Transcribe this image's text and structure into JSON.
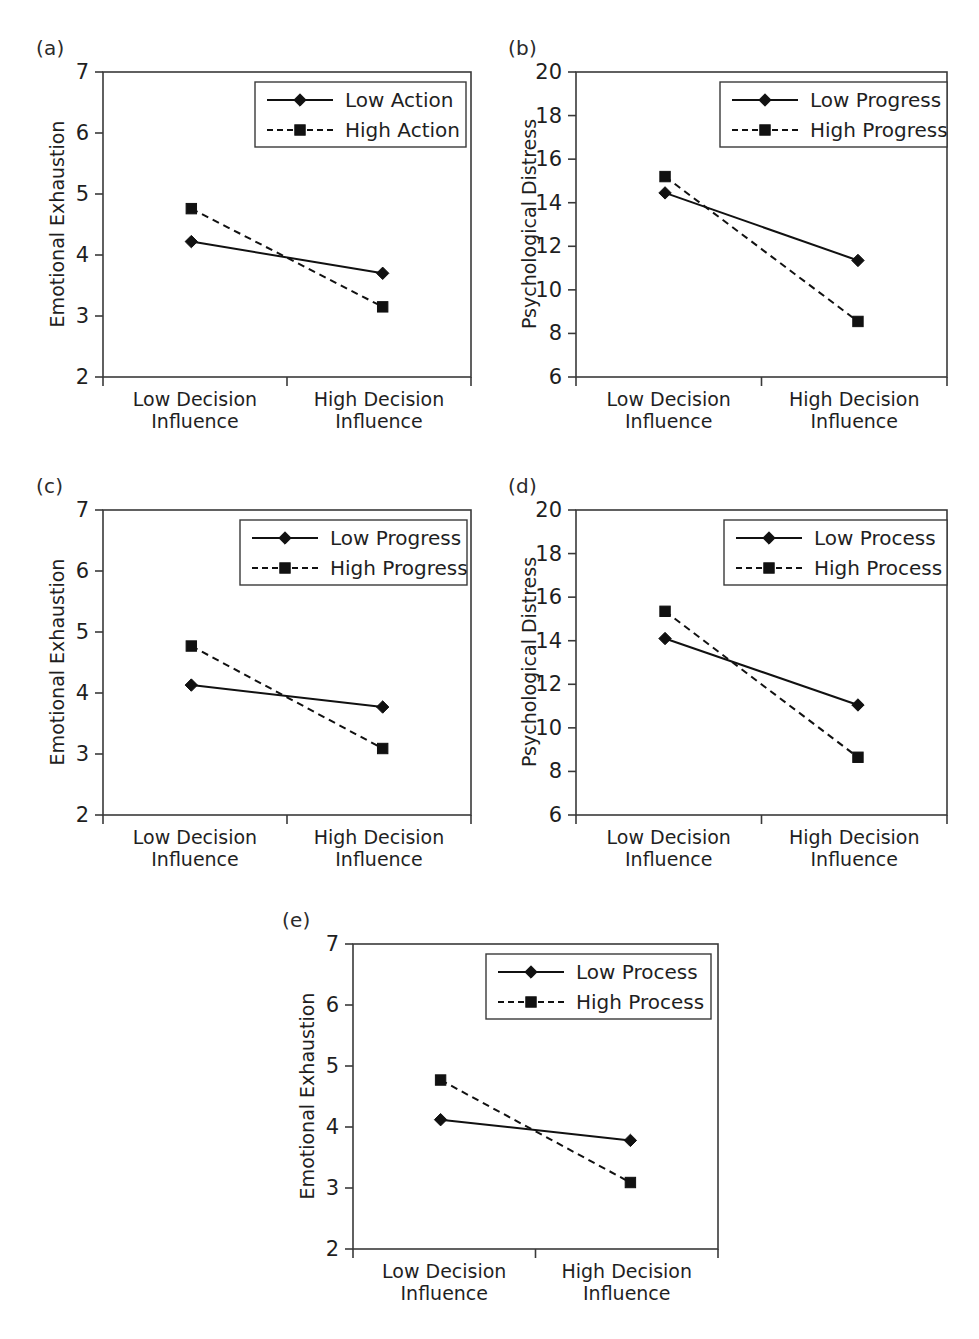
{
  "figure": {
    "panel_count": 5,
    "background": "#ffffff",
    "ink": "#1a1a1a"
  },
  "xaxis": {
    "categories": [
      "Low Decision\nInfluence",
      "High Decision\nInfluence"
    ],
    "cat_low_line1": "Low Decision",
    "cat_low_line2": "Influence",
    "cat_high_line1": "High Decision",
    "cat_high_line2": "Influence"
  },
  "panels": [
    {
      "letter": "(a)",
      "ylabel": "Emotional Exhaustion",
      "yticks": [
        "2",
        "3",
        "4",
        "5",
        "6",
        "7"
      ],
      "legend": [
        "Low Action",
        "High Action"
      ],
      "series_low_label": "Low Action",
      "series_high_label": "High Action"
    },
    {
      "letter": "(b)",
      "ylabel": "Psychological Distress",
      "yticks": [
        "6",
        "8",
        "10",
        "12",
        "14",
        "16",
        "18",
        "20"
      ],
      "legend": [
        "Low Progress",
        "High Progress"
      ],
      "series_low_label": "Low Progress",
      "series_high_label": "High Progress"
    },
    {
      "letter": "(c)",
      "ylabel": "Emotional Exhaustion",
      "yticks": [
        "2",
        "3",
        "4",
        "5",
        "6",
        "7"
      ],
      "legend": [
        "Low Progress",
        "High Progress"
      ],
      "series_low_label": "Low Progress",
      "series_high_label": "High Progress"
    },
    {
      "letter": "(d)",
      "ylabel": "Psychological Distress",
      "yticks": [
        "6",
        "8",
        "10",
        "12",
        "14",
        "16",
        "18",
        "20"
      ],
      "legend": [
        "Low Process",
        "High Process"
      ],
      "series_low_label": "Low Process",
      "series_high_label": "High Process"
    },
    {
      "letter": "(e)",
      "ylabel": "Emotional Exhaustion",
      "yticks": [
        "2",
        "3",
        "4",
        "5",
        "6",
        "7"
      ],
      "legend": [
        "Low Process",
        "High Process"
      ],
      "series_low_label": "Low Process",
      "series_high_label": "High Process"
    }
  ],
  "chart_data": [
    {
      "type": "line",
      "panel": "(a)",
      "title": "",
      "xlabel": "",
      "ylabel": "Emotional Exhaustion",
      "categories": [
        "Low Decision Influence",
        "High Decision Influence"
      ],
      "ylim": [
        2,
        7
      ],
      "yticks": [
        2,
        3,
        4,
        5,
        6,
        7
      ],
      "grid": false,
      "legend_position": "top-right",
      "series": [
        {
          "name": "Low Action",
          "style": "solid",
          "marker": "diamond",
          "values": [
            4.22,
            3.7
          ]
        },
        {
          "name": "High Action",
          "style": "dashed",
          "marker": "square",
          "values": [
            4.76,
            3.15
          ]
        }
      ]
    },
    {
      "type": "line",
      "panel": "(b)",
      "title": "",
      "xlabel": "",
      "ylabel": "Psychological Distress",
      "categories": [
        "Low Decision Influence",
        "High Decision Influence"
      ],
      "ylim": [
        6,
        20
      ],
      "yticks": [
        6,
        8,
        10,
        12,
        14,
        16,
        18,
        20
      ],
      "grid": false,
      "legend_position": "top-right",
      "series": [
        {
          "name": "Low Progress",
          "style": "solid",
          "marker": "diamond",
          "values": [
            14.45,
            11.35
          ]
        },
        {
          "name": "High Progress",
          "style": "dashed",
          "marker": "square",
          "values": [
            15.2,
            8.55
          ]
        }
      ]
    },
    {
      "type": "line",
      "panel": "(c)",
      "title": "",
      "xlabel": "",
      "ylabel": "Emotional Exhaustion",
      "categories": [
        "Low Decision Influence",
        "High Decision Influence"
      ],
      "ylim": [
        2,
        7
      ],
      "yticks": [
        2,
        3,
        4,
        5,
        6,
        7
      ],
      "grid": false,
      "legend_position": "top-right",
      "series": [
        {
          "name": "Low Progress",
          "style": "solid",
          "marker": "diamond",
          "values": [
            4.13,
            3.77
          ]
        },
        {
          "name": "High Progress",
          "style": "dashed",
          "marker": "square",
          "values": [
            4.77,
            3.09
          ]
        }
      ]
    },
    {
      "type": "line",
      "panel": "(d)",
      "title": "",
      "xlabel": "",
      "ylabel": "Psychological Distress",
      "categories": [
        "Low Decision Influence",
        "High Decision Influence"
      ],
      "ylim": [
        6,
        20
      ],
      "yticks": [
        6,
        8,
        10,
        12,
        14,
        16,
        18,
        20
      ],
      "grid": false,
      "legend_position": "top-right",
      "series": [
        {
          "name": "Low Process",
          "style": "solid",
          "marker": "diamond",
          "values": [
            14.1,
            11.05
          ]
        },
        {
          "name": "High Process",
          "style": "dashed",
          "marker": "square",
          "values": [
            15.35,
            8.65
          ]
        }
      ]
    },
    {
      "type": "line",
      "panel": "(e)",
      "title": "",
      "xlabel": "",
      "ylabel": "Emotional Exhaustion",
      "categories": [
        "Low Decision Influence",
        "High Decision Influence"
      ],
      "ylim": [
        2,
        7
      ],
      "yticks": [
        2,
        3,
        4,
        5,
        6,
        7
      ],
      "grid": false,
      "legend_position": "top-right",
      "series": [
        {
          "name": "Low Process",
          "style": "solid",
          "marker": "diamond",
          "values": [
            4.12,
            3.78
          ]
        },
        {
          "name": "High Process",
          "style": "dashed",
          "marker": "square",
          "values": [
            4.77,
            3.09
          ]
        }
      ]
    }
  ]
}
